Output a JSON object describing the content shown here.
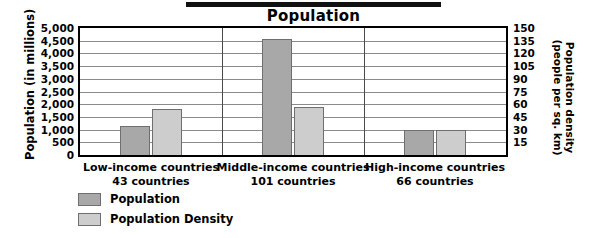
{
  "chart_data": {
    "type": "bar",
    "title": "Population",
    "xlabel": "",
    "categories": [
      {
        "label": "Low-income countries",
        "sublabel": "43 countries"
      },
      {
        "label": "Middle-income countries",
        "sublabel": "101 countries"
      },
      {
        "label": "High-income countries",
        "sublabel": "66 countries"
      }
    ],
    "series": [
      {
        "name": "Population",
        "axis": "left",
        "color": "#a8a8a8",
        "values": [
          1150,
          4550,
          1000
        ]
      },
      {
        "name": "Population Density",
        "axis": "right",
        "color": "#cdcdcd",
        "values": [
          54,
          57,
          30
        ]
      }
    ],
    "axes": {
      "left": {
        "title": "Population (in millions)",
        "ylim": [
          0,
          5000
        ],
        "ticks": [
          "5,000",
          "4,500",
          "4,000",
          "3,500",
          "3,000",
          "2,500",
          "2,000",
          "1,500",
          "1,000",
          "500",
          "0"
        ]
      },
      "right": {
        "title": "Population density (people per sq. km)",
        "ylim": [
          0,
          150
        ],
        "ticks": [
          "150",
          "135",
          "120",
          "105",
          "90",
          "75",
          "60",
          "45",
          "30",
          "15"
        ]
      }
    },
    "grid": true,
    "legend_position": "bottom-left",
    "legend": [
      "Population",
      "Population Density"
    ]
  }
}
